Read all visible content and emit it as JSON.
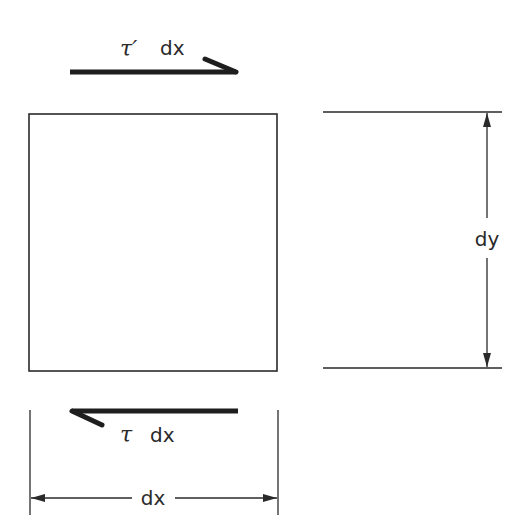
{
  "diagram": {
    "top_force": {
      "symbol": "τ′",
      "suffix": "dx",
      "direction": "right"
    },
    "bottom_force": {
      "symbol": "τ",
      "suffix": "dx",
      "direction": "left"
    },
    "width_dimension": {
      "label": "dx"
    },
    "height_dimension": {
      "label": "dy"
    },
    "colors": {
      "line": "#2a2a2a",
      "background": "#ffffff"
    }
  }
}
